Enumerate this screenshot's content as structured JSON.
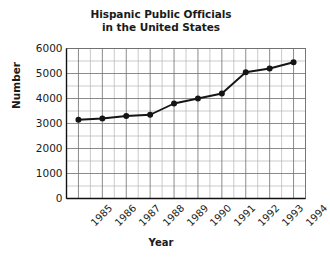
{
  "chart_data": {
    "type": "line",
    "title": "Hispanic Public Officials in the United States",
    "title_lines": [
      "Hispanic Public Officials",
      "in the United States"
    ],
    "xlabel": "Year",
    "ylabel": "Number",
    "categories": [
      "1985",
      "1986",
      "1987",
      "1988",
      "1989",
      "1990",
      "1991",
      "1992",
      "1993",
      "1994"
    ],
    "x": [
      1985,
      1986,
      1987,
      1988,
      1989,
      1990,
      1991,
      1992,
      1993,
      1994
    ],
    "values": [
      3150,
      3200,
      3300,
      3350,
      3800,
      4000,
      4200,
      5050,
      5200,
      5450
    ],
    "series": [
      {
        "name": "Hispanic Public Officials",
        "values": [
          3150,
          3200,
          3300,
          3350,
          3800,
          4000,
          4200,
          5050,
          5200,
          5450
        ]
      }
    ],
    "xlim": [
      1984.5,
      1994.5
    ],
    "ylim": [
      0,
      6000
    ],
    "ytick_labels": [
      "0",
      "1000",
      "2000",
      "3000",
      "4000",
      "5000",
      "6000"
    ],
    "ytick_values": [
      0,
      1000,
      2000,
      3000,
      4000,
      5000,
      6000
    ],
    "ytick_minor_step": 500,
    "xtick_minor_step": 0.5,
    "grid": true,
    "grid_minor": true,
    "legend": null,
    "legend_position": "none",
    "marker": "circle",
    "line_color": "#151515",
    "marker_color": "#151515",
    "grid_color": "#6f6f6f",
    "grid_minor_color": "#b5b5b5",
    "background_color": "#ffffff",
    "xtick_label_rotation": -45
  }
}
